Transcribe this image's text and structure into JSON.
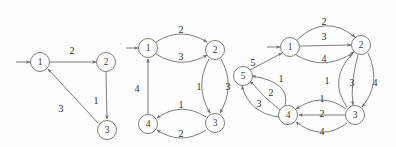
{
  "figure": {
    "background_color": "#fdfdfd",
    "stroke_color": "#707070",
    "text_color": "#2f2f2f"
  },
  "graphs": [
    {
      "name": "graph-1",
      "node_count": 3,
      "nodes": [
        {
          "id": "1",
          "label": "1",
          "x": 40,
          "y": 62
        },
        {
          "id": "2",
          "label": "2",
          "x": 106,
          "y": 62
        },
        {
          "id": "3",
          "label": "3",
          "x": 107,
          "y": 130
        }
      ],
      "entry_arrow": {
        "from_x": 16,
        "from_y": 62,
        "to_x": 31,
        "to_y": 62
      },
      "edges": [
        {
          "from": "1",
          "to": "2",
          "weight": "2",
          "label_x": 72,
          "label_y": 50
        },
        {
          "from": "2",
          "to": "3",
          "weight": "1",
          "label_x": 96,
          "label_y": 100
        },
        {
          "from": "3",
          "to": "1",
          "weight": "3",
          "label_x": 61,
          "label_y": 108
        }
      ]
    },
    {
      "name": "graph-2",
      "node_count": 4,
      "nodes": [
        {
          "id": "1",
          "label": "1",
          "x": 148,
          "y": 48
        },
        {
          "id": "2",
          "label": "2",
          "x": 215,
          "y": 50
        },
        {
          "id": "3",
          "label": "3",
          "x": 215,
          "y": 123
        },
        {
          "id": "4",
          "label": "4",
          "x": 148,
          "y": 124
        }
      ],
      "entry_arrow": {
        "from_x": 126,
        "from_y": 48,
        "to_x": 139,
        "to_y": 48
      },
      "edges": [
        {
          "from": "1",
          "to": "2",
          "weight": "2",
          "label_x": 181,
          "label_y": 29
        },
        {
          "from": "1",
          "to": "2",
          "weight": "3",
          "label_x": 181,
          "label_y": 56
        },
        {
          "from": "2",
          "to": "3",
          "weight": "3",
          "label_x": 228,
          "label_y": 86
        },
        {
          "from": "2",
          "to": "3",
          "weight": "1",
          "label_x": 199,
          "label_y": 86
        },
        {
          "from": "3",
          "to": "4",
          "weight": "1",
          "label_x": 181,
          "label_y": 104
        },
        {
          "from": "3",
          "to": "4",
          "weight": "2",
          "label_x": 181,
          "label_y": 133
        },
        {
          "from": "4",
          "to": "1",
          "weight": "4",
          "label_x": 137,
          "label_y": 88
        }
      ]
    },
    {
      "name": "graph-3",
      "node_count": 5,
      "nodes": [
        {
          "id": "1",
          "label": "1",
          "x": 290,
          "y": 47
        },
        {
          "id": "2",
          "label": "2",
          "x": 361,
          "y": 45
        },
        {
          "id": "3",
          "label": "3",
          "x": 355,
          "y": 115
        },
        {
          "id": "4",
          "label": "4",
          "x": 288,
          "y": 115
        },
        {
          "id": "5",
          "label": "5",
          "x": 243,
          "y": 76
        }
      ],
      "entry_arrow": {
        "from_x": 267,
        "from_y": 47,
        "to_x": 281,
        "to_y": 47
      },
      "edges": [
        {
          "from": "1",
          "to": "2",
          "weight": "2",
          "label_x": 324,
          "label_y": 21
        },
        {
          "from": "1",
          "to": "2",
          "weight": "3",
          "label_x": 324,
          "label_y": 36
        },
        {
          "from": "1",
          "to": "2",
          "weight": "4",
          "label_x": 324,
          "label_y": 58
        },
        {
          "from": "2",
          "to": "3",
          "weight": "3",
          "label_x": 352,
          "label_y": 82
        },
        {
          "from": "2",
          "to": "3",
          "weight": "4",
          "label_x": 375,
          "label_y": 82
        },
        {
          "from": "3",
          "to": "2",
          "weight": "1",
          "label_x": 327,
          "label_y": 80
        },
        {
          "from": "3",
          "to": "4",
          "weight": "1",
          "label_x": 322,
          "label_y": 98
        },
        {
          "from": "3",
          "to": "4",
          "weight": "2",
          "label_x": 322,
          "label_y": 113
        },
        {
          "from": "3",
          "to": "4",
          "weight": "4",
          "label_x": 322,
          "label_y": 131
        },
        {
          "from": "4",
          "to": "5",
          "weight": "1",
          "label_x": 281,
          "label_y": 78
        },
        {
          "from": "4",
          "to": "5",
          "weight": "2",
          "label_x": 271,
          "label_y": 92
        },
        {
          "from": "4",
          "to": "5",
          "weight": "3",
          "label_x": 259,
          "label_y": 103
        },
        {
          "from": "5",
          "to": "1",
          "weight": "5",
          "label_x": 253,
          "label_y": 62
        }
      ]
    }
  ]
}
